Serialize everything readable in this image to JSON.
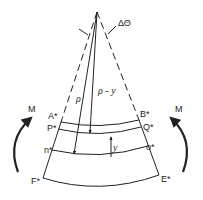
{
  "figure": {
    "type": "bending beam segment diagram",
    "labels": {
      "delta_theta": "ΔΘ",
      "rho": "ρ",
      "rho_minus_y": "ρ - y",
      "y": "y",
      "A": "A*",
      "B": "B*",
      "P": "P*",
      "Q": "Q*",
      "n": "n*",
      "o": "o*",
      "F": "F*",
      "E": "E*",
      "M_left": "M",
      "M_right": "M"
    },
    "colors": {
      "ink": "#222222",
      "background": "#ffffff"
    }
  }
}
